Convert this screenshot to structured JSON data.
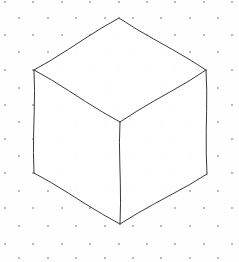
{
  "figure": {
    "canvas": {
      "width": 239,
      "height": 262
    },
    "background_color": "#fefefe",
    "line_color": "#3a3a3a",
    "line_width": "1",
    "face_fill": "#ffffff"
  },
  "chart_data": {
    "type": "scatter",
    "xlabel": "",
    "ylabel": "",
    "xlim": [
      0,
      239
    ],
    "ylim": [
      0,
      262
    ],
    "grid": true,
    "legend": "none",
    "annotations": [
      "isometric cube",
      "isometric dot grid"
    ],
    "vertices": {
      "top": [
        119,
        18
      ],
      "left_upper": [
        34,
        70
      ],
      "right_upper": [
        206,
        70
      ],
      "center": [
        120,
        122
      ],
      "left_lower": [
        34,
        173
      ],
      "right_lower": [
        207,
        174
      ],
      "bottom": [
        120,
        224
      ]
    },
    "faces": [
      {
        "name": "top-face",
        "points": [
          [
            119,
            18
          ],
          [
            206,
            70
          ],
          [
            120,
            122
          ],
          [
            34,
            70
          ]
        ]
      },
      {
        "name": "left-face",
        "points": [
          [
            34,
            70
          ],
          [
            120,
            122
          ],
          [
            120,
            224
          ],
          [
            34,
            173
          ]
        ]
      },
      {
        "name": "right-face",
        "points": [
          [
            120,
            122
          ],
          [
            206,
            70
          ],
          [
            207,
            174
          ],
          [
            120,
            224
          ]
        ]
      }
    ],
    "edges": [
      {
        "name": "top-to-left-upper",
        "from": [
          119,
          18
        ],
        "to": [
          34,
          70
        ]
      },
      {
        "name": "top-to-right-upper",
        "from": [
          119,
          18
        ],
        "to": [
          206,
          70
        ]
      },
      {
        "name": "left-upper-to-center",
        "from": [
          34,
          70
        ],
        "to": [
          120,
          122
        ]
      },
      {
        "name": "right-upper-to-center",
        "from": [
          206,
          70
        ],
        "to": [
          120,
          122
        ]
      },
      {
        "name": "left-upper-to-left-lower",
        "from": [
          34,
          70
        ],
        "to": [
          34,
          173
        ]
      },
      {
        "name": "right-upper-to-right-lower",
        "from": [
          206,
          70
        ],
        "to": [
          207,
          174
        ]
      },
      {
        "name": "center-to-bottom",
        "from": [
          120,
          122
        ],
        "to": [
          120,
          224
        ]
      },
      {
        "name": "left-lower-to-bottom",
        "from": [
          34,
          173
        ],
        "to": [
          120,
          224
        ]
      },
      {
        "name": "right-lower-to-bottom",
        "from": [
          207,
          174
        ],
        "to": [
          120,
          224
        ]
      }
    ],
    "grid_dots": {
      "color": "#b9b9b9",
      "radius": 0.75,
      "column_spacing": 28.5,
      "row_spacing": 17,
      "stagger": "isometric",
      "x": [
        5,
        33,
        62,
        90,
        119,
        147,
        175,
        204,
        232,
        19,
        48,
        76,
        105,
        133,
        161,
        190,
        218,
        5,
        33,
        62,
        90,
        119,
        147,
        175,
        204,
        232,
        19,
        48,
        76,
        105,
        133,
        161,
        190,
        218,
        5,
        33,
        62,
        90,
        119,
        147,
        175,
        204,
        232,
        19,
        48,
        76,
        105,
        133,
        161,
        190,
        218,
        5,
        33,
        62,
        90,
        119,
        147,
        175,
        204,
        232,
        19,
        48,
        76,
        105,
        133,
        161,
        190,
        218,
        5,
        33,
        62,
        90,
        119,
        147,
        175,
        204,
        232,
        19,
        48,
        76,
        105,
        133,
        161,
        190,
        218,
        5,
        33,
        62,
        90,
        119,
        147,
        175,
        204,
        232,
        19,
        48,
        76,
        105,
        133,
        161,
        190,
        218,
        5,
        33,
        62,
        90,
        119,
        147,
        175,
        204,
        232,
        19,
        48,
        76,
        105,
        133,
        161,
        190,
        218,
        5,
        33,
        62,
        90,
        119,
        147,
        175,
        204,
        232,
        19,
        48,
        76,
        105,
        133,
        161,
        190,
        218
      ],
      "y": [
        2,
        2,
        2,
        2,
        2,
        2,
        2,
        2,
        2,
        18,
        18,
        18,
        18,
        18,
        18,
        18,
        18,
        35,
        35,
        35,
        35,
        35,
        35,
        35,
        35,
        35,
        52,
        52,
        52,
        52,
        52,
        52,
        52,
        52,
        70,
        70,
        70,
        70,
        70,
        70,
        70,
        70,
        70,
        88,
        88,
        88,
        88,
        88,
        88,
        88,
        88,
        105,
        105,
        105,
        105,
        105,
        105,
        105,
        105,
        105,
        122,
        122,
        122,
        122,
        122,
        122,
        122,
        122,
        139,
        139,
        139,
        139,
        139,
        139,
        139,
        139,
        139,
        156,
        156,
        156,
        156,
        156,
        156,
        156,
        156,
        173,
        173,
        173,
        173,
        173,
        173,
        173,
        173,
        173,
        191,
        191,
        191,
        191,
        191,
        191,
        191,
        191,
        208,
        208,
        208,
        208,
        208,
        208,
        208,
        208,
        208,
        226,
        226,
        226,
        226,
        226,
        226,
        226,
        226,
        244,
        244,
        244,
        244,
        244,
        244,
        244,
        244,
        244,
        258,
        258,
        258,
        258,
        258,
        258,
        258,
        258
      ]
    }
  }
}
